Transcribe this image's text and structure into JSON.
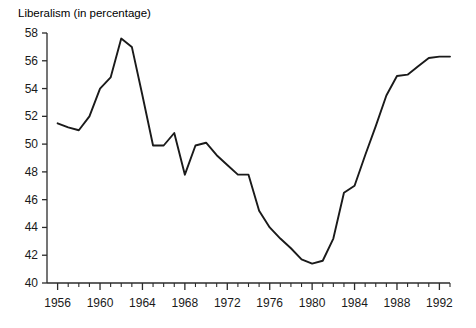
{
  "chart_data": {
    "type": "line",
    "title": "Liberalism (in percentage)",
    "xlabel": "",
    "ylabel": "",
    "ylim": [
      40,
      58
    ],
    "xlim": [
      1955,
      1993
    ],
    "grid": false,
    "legend": false,
    "y_ticks": [
      40,
      42,
      44,
      46,
      48,
      50,
      52,
      54,
      56,
      58
    ],
    "y_tick_labels": [
      "40",
      "42",
      "44",
      "46",
      "48",
      "50",
      "52",
      "54",
      "56",
      "58"
    ],
    "x_ticks": [
      1956,
      1960,
      1964,
      1968,
      1972,
      1976,
      1980,
      1984,
      1988,
      1992
    ],
    "x_tick_labels": [
      "1956",
      "1960",
      "1964",
      "1968",
      "1972",
      "1976",
      "1980",
      "1984",
      "1988",
      "1992"
    ],
    "x_minor_tick_step": 1,
    "series": [
      {
        "name": "Liberalism",
        "color": "#1a1a1a",
        "x": [
          1956,
          1957,
          1958,
          1959,
          1960,
          1961,
          1962,
          1963,
          1964,
          1965,
          1966,
          1967,
          1968,
          1969,
          1970,
          1971,
          1972,
          1973,
          1974,
          1975,
          1976,
          1977,
          1978,
          1979,
          1980,
          1981,
          1982,
          1983,
          1984,
          1985,
          1986,
          1987,
          1988,
          1989,
          1990,
          1991,
          1992,
          1993
        ],
        "values": [
          51.5,
          51.2,
          51.0,
          52.0,
          54.0,
          54.8,
          57.6,
          57.0,
          53.5,
          49.9,
          49.9,
          50.8,
          47.8,
          49.9,
          50.1,
          49.2,
          48.5,
          47.8,
          47.8,
          45.2,
          44.0,
          43.2,
          42.5,
          41.7,
          41.4,
          41.6,
          43.2,
          46.5,
          47.0,
          49.2,
          51.3,
          53.5,
          54.9,
          55.0,
          55.6,
          56.2,
          56.3,
          56.3
        ]
      }
    ]
  }
}
